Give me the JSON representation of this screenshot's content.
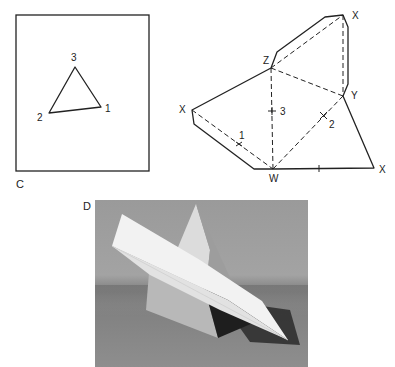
{
  "figure": {
    "panel_c": {
      "letter": "C",
      "triangle_vertices": [
        {
          "label": "3",
          "x": 75,
          "y": 67
        },
        {
          "label": "2",
          "x": 49,
          "y": 113
        },
        {
          "label": "1",
          "x": 101,
          "y": 107
        }
      ]
    },
    "net_diagram": {
      "vertex_labels": {
        "z": "Z",
        "x_top": "X",
        "y": "Y",
        "x_left": "X",
        "w": "W",
        "x_right": "X"
      },
      "edge_labels": {
        "one": "1",
        "two": "2",
        "three": "3"
      }
    },
    "panel_d": {
      "letter": "D",
      "description": "Photograph of a paper tetrahedron pierced by a folded paper plane"
    }
  }
}
